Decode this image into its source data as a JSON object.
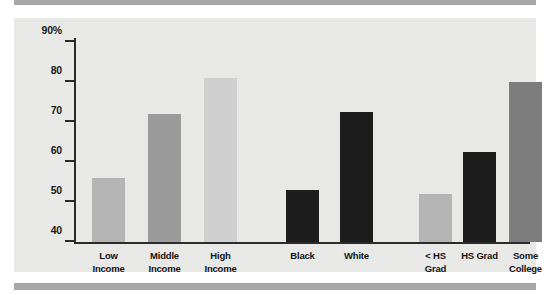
{
  "figure": {
    "panel_bg": "#e8e8e6",
    "rule_color": "#a8a8a8",
    "axis_color": "#2b2b2b"
  },
  "chart_data": {
    "type": "bar",
    "title": "",
    "xlabel": "",
    "ylabel": "",
    "ylim": [
      40,
      90
    ],
    "grid": false,
    "legend": "none",
    "ytick_labels": [
      "90%",
      "80",
      "70",
      "60",
      "50",
      "40"
    ],
    "ytick_values": [
      90,
      80,
      70,
      60,
      50,
      40
    ],
    "categories": [
      "Low Income",
      "Middle Income",
      "High Income",
      "Black",
      "White",
      "< HS Grad",
      "HS Grad",
      "Some College"
    ],
    "values": [
      56,
      72,
      81,
      53,
      72.5,
      52,
      62.5,
      80
    ],
    "bars": [
      {
        "label_line1": "Low",
        "label_line2": "Income",
        "value": 56,
        "color": "#b4b4b4",
        "group": "income"
      },
      {
        "label_line1": "Middle",
        "label_line2": "Income",
        "value": 72,
        "color": "#9b9b9b",
        "group": "income"
      },
      {
        "label_line1": "High",
        "label_line2": "Income",
        "value": 81,
        "color": "#cfcfcf",
        "group": "income"
      },
      {
        "label_line1": "Black",
        "label_line2": "",
        "value": 53,
        "color": "#1c1c1c",
        "group": "race"
      },
      {
        "label_line1": "White",
        "label_line2": "",
        "value": 72.5,
        "color": "#1c1c1c",
        "group": "race"
      },
      {
        "label_line1": "< HS",
        "label_line2": "Grad",
        "value": 52,
        "color": "#b4b4b4",
        "group": "education"
      },
      {
        "label_line1": "HS Grad",
        "label_line2": "",
        "value": 62.5,
        "color": "#1c1c1c",
        "group": "education"
      },
      {
        "label_line1": "Some",
        "label_line2": "College",
        "value": 80,
        "color": "#7d7d7d",
        "group": "education"
      }
    ]
  }
}
